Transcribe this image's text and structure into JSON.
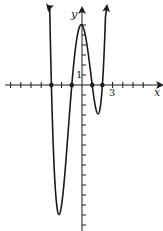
{
  "chart_data": {
    "type": "line",
    "title": "",
    "xlabel": "x",
    "ylabel": "y",
    "tick_labels": {
      "x": "3",
      "y": "1"
    },
    "function": "f(x) = (x+3)(x+1)(x-1)(x-2)",
    "x_intercepts": [
      -3,
      -1,
      1,
      2
    ],
    "local_extrema": [
      {
        "type": "min",
        "x": -2.1,
        "y": -12.0
      },
      {
        "type": "max",
        "x": 0.1,
        "y": 6.0
      },
      {
        "type": "min",
        "x": 1.5,
        "y": -2.8
      }
    ],
    "xlim": [
      -8,
      7
    ],
    "ylim": [
      -16,
      8
    ],
    "grid": false,
    "arrows": "both ends of curve point upward; axes have arrowheads",
    "color": "#1a1a1a"
  },
  "labels": {
    "x_axis": "x",
    "y_axis": "y",
    "x_tick": "3",
    "y_tick": "1"
  }
}
